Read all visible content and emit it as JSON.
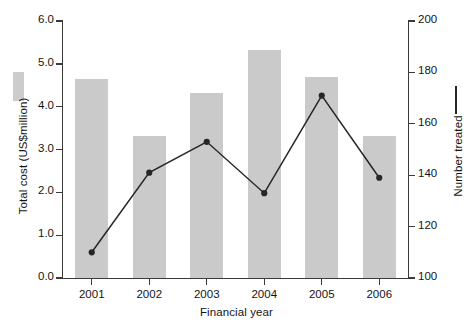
{
  "chart_data": {
    "type": "bar",
    "title": "",
    "xlabel": "Financial year",
    "ylabel": "Total cost (US$million)",
    "y2label": "Number treated",
    "categories": [
      "2001",
      "2002",
      "2003",
      "2004",
      "2005",
      "2006"
    ],
    "ylim": [
      0.0,
      6.0
    ],
    "yticks": [
      "0.0",
      "1.0",
      "2.0",
      "3.0",
      "4.0",
      "5.0",
      "6.0"
    ],
    "y2lim": [
      100,
      200
    ],
    "y2ticks": [
      "100",
      "120",
      "140",
      "160",
      "180",
      "200"
    ],
    "grid": false,
    "legend_position": "axis-labels",
    "series": [
      {
        "name": "Total cost (US$million)",
        "type": "bar",
        "axis": "left",
        "color": "#cacaca",
        "values": [
          4.65,
          3.31,
          4.33,
          5.32,
          4.7,
          3.32
        ]
      },
      {
        "name": "Number treated",
        "type": "line",
        "axis": "right",
        "color": "#262626",
        "marker": "filled-circle",
        "values": [
          110,
          141,
          153,
          133,
          171,
          139
        ]
      }
    ]
  },
  "axes": {
    "left": {
      "title": "Total cost (US$million)",
      "ticks": [
        "6.0",
        "5.0",
        "4.0",
        "3.0",
        "2.0",
        "1.0",
        "0.0"
      ]
    },
    "right": {
      "title": "Number treated",
      "ticks": [
        "200",
        "180",
        "160",
        "140",
        "120",
        "100"
      ]
    },
    "bottom": {
      "title": "Financial year",
      "ticks": [
        "2001",
        "2002",
        "2003",
        "2004",
        "2005",
        "2006"
      ]
    }
  },
  "legend": {
    "bar_key": "bar-swatch",
    "line_key": "line-swatch"
  },
  "caption": ""
}
